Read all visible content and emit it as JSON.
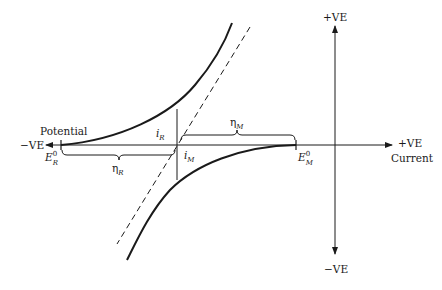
{
  "diagram": {
    "colors": {
      "line": "#1a1a1a",
      "background": "#ffffff"
    },
    "axes": {
      "horizontal": {
        "left_label": "−VE",
        "right_label": "+VE",
        "left_caption": "Potential",
        "right_caption": "Current"
      },
      "vertical": {
        "top_label": "+VE",
        "bottom_label": "−VE"
      }
    },
    "labels": {
      "E_R": {
        "base": "E",
        "sub": "R",
        "sup": "0"
      },
      "E_M": {
        "base": "E",
        "sub": "M",
        "sup": "0"
      },
      "i_R": {
        "base": "i",
        "sub": "R"
      },
      "i_M": {
        "base": "i",
        "sub": "M"
      },
      "eta_R": {
        "base": "η",
        "sub": "R"
      },
      "eta_M": {
        "base": "η",
        "sub": "M"
      }
    },
    "elements": [
      "upper anodic curve from E_R^0",
      "lower cathodic curve from E_M^0",
      "dashed line through mixed potential",
      "vertical line at mixed potential",
      "brace eta_R",
      "brace eta_M"
    ]
  }
}
